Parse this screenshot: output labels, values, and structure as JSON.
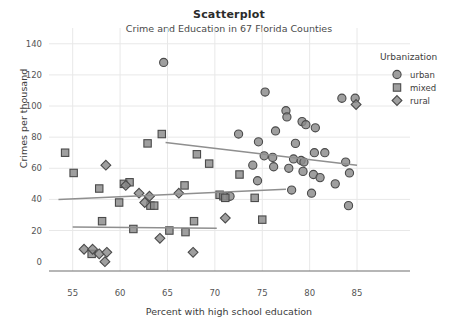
{
  "chart_data": {
    "type": "scatter",
    "title": "Scatterplot",
    "subtitle": "Crime and Education in 67 Florida Counties",
    "xlabel": "Percent with high school education",
    "ylabel": "Crimes per thousand",
    "xlim": [
      52.5,
      87
    ],
    "ylim": [
      -6,
      145
    ],
    "xticks": [
      55,
      60,
      65,
      70,
      75,
      80,
      85
    ],
    "yticks": [
      0,
      20,
      40,
      60,
      80,
      100,
      120,
      140
    ],
    "grid": true,
    "legend": {
      "title": "Urbanization",
      "position": "right",
      "entries": [
        {
          "name": "urban",
          "marker": "circle"
        },
        {
          "name": "mixed",
          "marker": "square"
        },
        {
          "name": "rural",
          "marker": "diamond"
        }
      ]
    },
    "marker_fill": "#8a8a8a",
    "marker_stroke": "#4a4a4a",
    "trend_color": "#8f8f8f",
    "grid_color": "#e8e8e8",
    "axis_color": "#6f6f6f",
    "series": [
      {
        "name": "urban",
        "marker": "circle",
        "points": [
          [
            64.6,
            128
          ],
          [
            75.3,
            109
          ],
          [
            83.4,
            105
          ],
          [
            84.8,
            105
          ],
          [
            77.5,
            97
          ],
          [
            77.6,
            93
          ],
          [
            79.2,
            90
          ],
          [
            79.6,
            88
          ],
          [
            80.6,
            86
          ],
          [
            76.4,
            84
          ],
          [
            72.5,
            82
          ],
          [
            74.6,
            77
          ],
          [
            78.5,
            76
          ],
          [
            80.5,
            70
          ],
          [
            81.6,
            70
          ],
          [
            75.2,
            68
          ],
          [
            76.1,
            67
          ],
          [
            78.3,
            66
          ],
          [
            79.1,
            65
          ],
          [
            79.4,
            64
          ],
          [
            83.8,
            64
          ],
          [
            74.0,
            62
          ],
          [
            76.2,
            61
          ],
          [
            77.8,
            60
          ],
          [
            79.3,
            58
          ],
          [
            84.2,
            57
          ],
          [
            80.4,
            56
          ],
          [
            81.1,
            54
          ],
          [
            74.5,
            52
          ],
          [
            82.7,
            50
          ],
          [
            78.1,
            46
          ],
          [
            80.2,
            44
          ],
          [
            84.1,
            36
          ],
          [
            71.6,
            42
          ]
        ]
      },
      {
        "name": "mixed",
        "marker": "square",
        "points": [
          [
            64.4,
            82
          ],
          [
            62.9,
            76
          ],
          [
            68.1,
            69
          ],
          [
            69.4,
            63
          ],
          [
            54.2,
            70
          ],
          [
            55.1,
            57
          ],
          [
            57.8,
            47
          ],
          [
            60.4,
            50
          ],
          [
            61.0,
            51
          ],
          [
            66.8,
            49
          ],
          [
            70.5,
            43
          ],
          [
            70.9,
            42
          ],
          [
            71.1,
            41
          ],
          [
            74.2,
            41
          ],
          [
            59.9,
            38
          ],
          [
            63.2,
            36
          ],
          [
            63.6,
            36
          ],
          [
            72.6,
            56
          ],
          [
            75.0,
            27
          ],
          [
            67.8,
            26
          ],
          [
            58.1,
            26
          ],
          [
            61.4,
            21
          ],
          [
            65.2,
            20
          ],
          [
            66.9,
            19
          ],
          [
            57.0,
            5
          ]
        ]
      },
      {
        "name": "rural",
        "marker": "diamond",
        "points": [
          [
            58.5,
            62
          ],
          [
            60.6,
            49
          ],
          [
            62.0,
            44
          ],
          [
            63.1,
            42
          ],
          [
            66.2,
            44
          ],
          [
            62.6,
            38
          ],
          [
            64.2,
            15
          ],
          [
            71.1,
            28
          ],
          [
            56.2,
            8
          ],
          [
            57.1,
            8
          ],
          [
            57.8,
            5
          ],
          [
            58.6,
            6
          ],
          [
            58.4,
            0
          ],
          [
            67.7,
            6
          ],
          [
            84.9,
            101
          ]
        ]
      }
    ],
    "trend_lines": [
      {
        "name": "urban",
        "x0": 64.8,
        "y0": 76.5,
        "x1": 85.0,
        "y1": 62.0
      },
      {
        "name": "mixed",
        "x0": 53.5,
        "y0": 40.0,
        "x1": 77.5,
        "y1": 46.5
      },
      {
        "name": "rural",
        "x0": 55.0,
        "y0": 22.2,
        "x1": 70.2,
        "y1": 21.5
      }
    ]
  }
}
